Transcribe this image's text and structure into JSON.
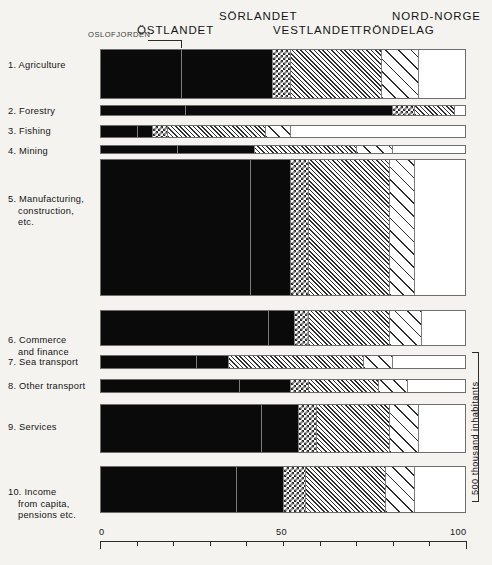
{
  "chart_data": {
    "type": "bar",
    "orientation": "horizontal",
    "stacked": true,
    "normalized_percent": true,
    "title": "",
    "subtitle": "",
    "xlabel": "",
    "ylabel": "",
    "xlim": [
      0,
      100
    ],
    "xticks": [
      0,
      10,
      20,
      30,
      40,
      50,
      60,
      70,
      80,
      90,
      100
    ],
    "xticklabels": [
      "0",
      "",
      "",
      "",
      "",
      "50",
      "",
      "",
      "",
      "",
      "100"
    ],
    "grid": false,
    "legend_position": "top",
    "right_axis_note": "500 thousand inhabitants",
    "categories": [
      "1. Agriculture",
      "2. Forestry",
      "3. Fishing",
      "4. Mining",
      "5. Manufacturing, construction, etc.",
      "6. Commerce and finance",
      "7. Sea transport",
      "8. Other transport",
      "9. Services",
      "10. Income from capita, pensions etc."
    ],
    "series": [
      {
        "name": "Oslofjorden",
        "pattern": "solid",
        "values": [
          22,
          23,
          10,
          21,
          41,
          46,
          26,
          38,
          44,
          37
        ]
      },
      {
        "name": "Östlandet",
        "pattern": "solid",
        "values": [
          25,
          57,
          4,
          21,
          11,
          7,
          9,
          14,
          10,
          13
        ]
      },
      {
        "name": "Sörlandet",
        "pattern": "check",
        "values": [
          5,
          6,
          4,
          0,
          5,
          4,
          0,
          5,
          5,
          6
        ]
      },
      {
        "name": "Vestlandet",
        "pattern": "hatch",
        "values": [
          25,
          11,
          27,
          28,
          22,
          22,
          37,
          19,
          20,
          22
        ]
      },
      {
        "name": "Tröndelag",
        "pattern": "sparse",
        "values": [
          10,
          0,
          7,
          10,
          7,
          9,
          8,
          8,
          8,
          8
        ]
      },
      {
        "name": "Nord-Norge",
        "pattern": "white",
        "values": [
          13,
          3,
          48,
          20,
          14,
          12,
          20,
          16,
          13,
          14
        ]
      }
    ]
  },
  "header": {
    "regions": [
      {
        "name": "oslofjorden",
        "label": "OSLOFJORDEN"
      },
      {
        "name": "ostlandet",
        "label": "ÖSTLANDET"
      },
      {
        "name": "sorlandet",
        "label": "SÖRLANDET"
      },
      {
        "name": "vestlandet",
        "label": "VESTLANDET"
      },
      {
        "name": "trondelag",
        "label": "TRÖNDELAG"
      },
      {
        "name": "nordnorge",
        "label": "NORD-NORGE"
      }
    ]
  },
  "rows": [
    {
      "lines": [
        "1. Agriculture"
      ]
    },
    {
      "lines": [
        "2. Forestry"
      ]
    },
    {
      "lines": [
        "3. Fishing"
      ]
    },
    {
      "lines": [
        "4. Mining"
      ]
    },
    {
      "lines": [
        "5. Manufacturing,",
        "construction,",
        "etc."
      ]
    },
    {
      "lines": [
        "6. Commerce",
        "and finance"
      ]
    },
    {
      "lines": [
        "7. Sea transport"
      ]
    },
    {
      "lines": [
        "8. Other transport"
      ]
    },
    {
      "lines": [
        "9. Services"
      ]
    },
    {
      "lines": [
        "10. Income",
        "from capita,",
        "pensions etc."
      ]
    }
  ],
  "axis": {
    "labels": [
      {
        "value": 0,
        "text": "0"
      },
      {
        "value": 50,
        "text": "50"
      },
      {
        "value": 100,
        "text": "100"
      }
    ]
  },
  "right_scale": {
    "note": "500 thousand inhabitants"
  }
}
